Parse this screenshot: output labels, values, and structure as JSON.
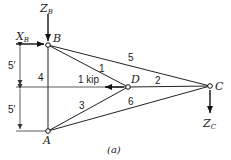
{
  "figure": {
    "caption": "(a)",
    "nodes": {
      "A": {
        "label": "A",
        "x": 48,
        "y": 131
      },
      "B": {
        "label": "B",
        "x": 48,
        "y": 45
      },
      "C": {
        "label": "C",
        "x": 210,
        "y": 86
      },
      "D": {
        "label": "D",
        "x": 128,
        "y": 87
      }
    },
    "members": [
      {
        "id": "1",
        "label": "1",
        "from": "B",
        "to": "D"
      },
      {
        "id": "2",
        "label": "2",
        "from": "D",
        "to": "C"
      },
      {
        "id": "3",
        "label": "3",
        "from": "A",
        "to": "D"
      },
      {
        "id": "4",
        "label": "4",
        "from": "A",
        "to": "B"
      },
      {
        "id": "5",
        "label": "5",
        "from": "B",
        "to": "C"
      },
      {
        "id": "6",
        "label": "6",
        "from": "A",
        "to": "C"
      }
    ],
    "loads": {
      "applied": {
        "label": "1 kip",
        "at": "D",
        "direction": "left"
      },
      "reaction_xb": {
        "main": "X",
        "sub": "B",
        "direction": "right"
      },
      "reaction_zb": {
        "main": "Z",
        "sub": "B",
        "direction": "down"
      },
      "reaction_zc": {
        "main": "Z",
        "sub": "C",
        "direction": "down"
      }
    },
    "dimensions": {
      "upper": "5′",
      "lower": "5′"
    }
  }
}
